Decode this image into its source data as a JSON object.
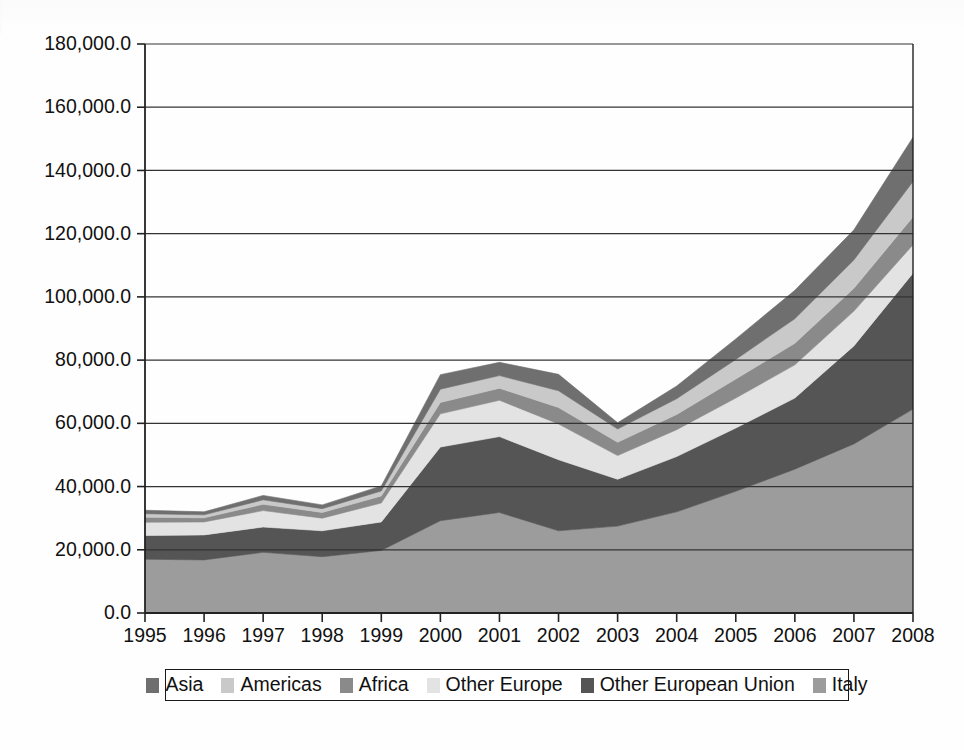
{
  "chart_data": {
    "type": "area",
    "stacked": true,
    "title": "",
    "xlabel": "",
    "ylabel": "",
    "grid": true,
    "legend_position": "bottom",
    "categories": [
      "1995",
      "1996",
      "1997",
      "1998",
      "1999",
      "2000",
      "2001",
      "2002",
      "2003",
      "2004",
      "2005",
      "2006",
      "2007",
      "2008"
    ],
    "x": [
      1995,
      1996,
      1997,
      1998,
      1999,
      2000,
      2001,
      2002,
      2003,
      2004,
      2005,
      2006,
      2007,
      2008
    ],
    "ylim": [
      0,
      180000
    ],
    "ytick_values": [
      0,
      20000,
      40000,
      60000,
      80000,
      100000,
      120000,
      140000,
      160000,
      180000
    ],
    "ytick_labels": [
      "0.0",
      "20,000.0",
      "40,000.0",
      "60,000.0",
      "80,000.0",
      "100,000.0",
      "120,000.0",
      "140,000.0",
      "160,000.0",
      "180,000.0"
    ],
    "xtick_labels": [
      "1995",
      "1996",
      "1997",
      "1998",
      "1999",
      "2000",
      "2001",
      "2002",
      "2003",
      "2004",
      "2005",
      "2006",
      "2007",
      "2008"
    ],
    "stack_order_bottom_to_top": [
      "Italy",
      "Other European Union",
      "Other Europe",
      "Africa",
      "Americas",
      "Asia"
    ],
    "series": [
      {
        "name": "Italy",
        "color": "#9c9c9c",
        "values": [
          17000,
          16800,
          19200,
          17800,
          19800,
          29200,
          31800,
          26000,
          27500,
          32000,
          38500,
          45500,
          53500,
          64500
        ]
      },
      {
        "name": "Other European Union",
        "color": "#555555",
        "values": [
          7500,
          7900,
          8000,
          8200,
          9000,
          23300,
          24000,
          22500,
          14800,
          17500,
          20000,
          22500,
          31000,
          43000
        ]
      },
      {
        "name": "Other Europe",
        "color": "#e3e3e3",
        "values": [
          4200,
          4100,
          5200,
          4000,
          6000,
          10500,
          11500,
          11300,
          7500,
          8500,
          9500,
          10500,
          11000,
          9000
        ]
      },
      {
        "name": "Africa",
        "color": "#8a8a8a",
        "values": [
          1600,
          1300,
          2000,
          1800,
          2200,
          3600,
          3800,
          5200,
          4200,
          4800,
          6000,
          6800,
          7200,
          8800
        ]
      },
      {
        "name": "Americas",
        "color": "#c9c9c9",
        "values": [
          1100,
          950,
          1400,
          1200,
          1600,
          4200,
          4000,
          5300,
          4200,
          5000,
          6200,
          7800,
          9000,
          11200
        ]
      },
      {
        "name": "Asia",
        "color": "#6f6f6f",
        "values": [
          1100,
          950,
          1400,
          1200,
          1600,
          4600,
          4200,
          5200,
          2000,
          4000,
          6500,
          9000,
          9500,
          14000
        ]
      }
    ],
    "totals": [
      32500,
      32000,
      37200,
      34200,
      40200,
      75400,
      79300,
      75500,
      60200,
      71800,
      86700,
      102100,
      121200,
      150500
    ]
  },
  "legend": {
    "items": [
      {
        "label": "Asia",
        "color": "#6f6f6f"
      },
      {
        "label": "Americas",
        "color": "#c9c9c9"
      },
      {
        "label": "Africa",
        "color": "#8a8a8a"
      },
      {
        "label": "Other Europe",
        "color": "#e3e3e3"
      },
      {
        "label": "Other European Union",
        "color": "#555555"
      },
      {
        "label": "Italy",
        "color": "#9c9c9c"
      }
    ]
  },
  "axis": {
    "axis_line_color": "#222222",
    "gridline_color": "#333333"
  }
}
